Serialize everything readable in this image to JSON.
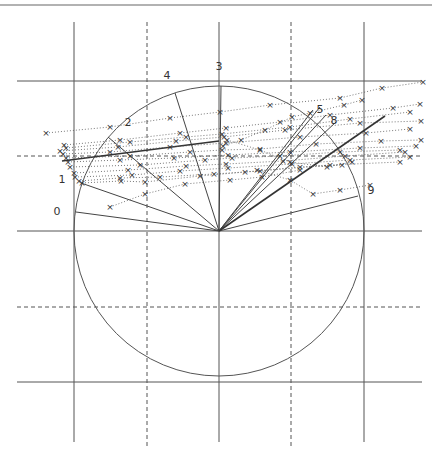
{
  "figure": {
    "top_rule": {
      "x1": 0,
      "x2": 432,
      "y": 5
    },
    "vertical_lines": [
      {
        "x": 74,
        "y1": 22,
        "y2": 442,
        "style": "solid"
      },
      {
        "x": 147,
        "y1": 22,
        "y2": 447,
        "style": "dashed"
      },
      {
        "x": 219,
        "y1": 22,
        "y2": 442,
        "style": "solid"
      },
      {
        "x": 291,
        "y1": 22,
        "y2": 447,
        "style": "dashed"
      },
      {
        "x": 364,
        "y1": 22,
        "y2": 442,
        "style": "solid"
      }
    ],
    "horizontal_lines": [
      {
        "y": 81,
        "x1": 17,
        "x2": 422,
        "style": "solid"
      },
      {
        "y": 156,
        "x1": 17,
        "x2": 422,
        "style": "dashed"
      },
      {
        "y": 231,
        "x1": 17,
        "x2": 422,
        "style": "solid"
      },
      {
        "y": 307,
        "x1": 17,
        "x2": 422,
        "style": "dashed"
      },
      {
        "y": 382,
        "x1": 17,
        "x2": 422,
        "style": "solid"
      }
    ],
    "circle": {
      "cx": 219,
      "cy": 231,
      "r": 145
    },
    "spokes": [
      {
        "label": "0",
        "x": 76,
        "y": 212,
        "lx": 57,
        "ly": 215
      },
      {
        "label": "1",
        "x": 81,
        "y": 183,
        "lx": 62,
        "ly": 183
      },
      {
        "label": "2",
        "x": 108,
        "y": 137,
        "lx": 128,
        "ly": 126
      },
      {
        "label": "4",
        "x": 175,
        "y": 93,
        "lx": 167,
        "ly": 79
      },
      {
        "label": "3",
        "x": 221,
        "y": 86,
        "lx": 219,
        "ly": 70
      },
      {
        "label": "9",
        "x": 358,
        "y": 196,
        "lx": 371,
        "ly": 194
      },
      {
        "label": "8",
        "x": 336,
        "y": 122,
        "lx": 334,
        "ly": 124
      },
      {
        "label": "5",
        "x": 320,
        "y": 107,
        "lx": 320,
        "ly": 113
      }
    ],
    "extra_spokes": [
      {
        "x": 326,
        "y": 115
      },
      {
        "x": 313,
        "y": 110
      }
    ],
    "series_line_color": "#555555",
    "series": [
      {
        "pts": [
          [
            46,
            133
          ],
          [
            110,
            127
          ],
          [
            170,
            118
          ],
          [
            220,
            112
          ],
          [
            270,
            105
          ],
          [
            340,
            98
          ],
          [
            382,
            88
          ],
          [
            423,
            82
          ]
        ]
      },
      {
        "pts": [
          [
            64,
            145
          ],
          [
            120,
            140
          ],
          [
            180,
            133
          ],
          [
            226,
            128
          ],
          [
            280,
            122
          ],
          [
            330,
            115
          ],
          [
            393,
            108
          ],
          [
            420,
            104
          ]
        ]
      },
      {
        "pts": [
          [
            66,
            148
          ],
          [
            130,
            142
          ],
          [
            186,
            137
          ],
          [
            222,
            134
          ],
          [
            290,
            127
          ],
          [
            350,
            119
          ],
          [
            410,
            112
          ]
        ]
      },
      {
        "pts": [
          [
            60,
            151
          ],
          [
            118,
            147
          ],
          [
            176,
            141
          ],
          [
            224,
            137
          ],
          [
            285,
            130
          ],
          [
            360,
            123
          ],
          [
            421,
            121
          ]
        ]
      },
      {
        "pts": [
          [
            63,
            154
          ],
          [
            110,
            152
          ],
          [
            170,
            147
          ],
          [
            226,
            143
          ],
          [
            300,
            137
          ],
          [
            366,
            133
          ],
          [
            410,
            129
          ]
        ]
      },
      {
        "pts": [
          [
            66,
            158
          ],
          [
            130,
            156
          ],
          [
            190,
            152
          ],
          [
            222,
            150
          ],
          [
            260,
            149
          ],
          [
            316,
            144
          ],
          [
            381,
            141
          ],
          [
            421,
            140
          ]
        ]
      },
      {
        "pts": [
          [
            68,
            162
          ],
          [
            120,
            160
          ],
          [
            174,
            158
          ],
          [
            228,
            155
          ],
          [
            290,
            152
          ],
          [
            360,
            148
          ],
          [
            416,
            146
          ]
        ]
      },
      {
        "pts": [
          [
            70,
            167
          ],
          [
            140,
            165
          ],
          [
            205,
            160
          ],
          [
            232,
            158
          ],
          [
            280,
            156
          ],
          [
            340,
            152
          ],
          [
            400,
            150
          ]
        ]
      },
      {
        "pts": [
          [
            74,
            173
          ],
          [
            128,
            170
          ],
          [
            186,
            166
          ],
          [
            226,
            164
          ],
          [
            283,
            161
          ],
          [
            345,
            156
          ],
          [
            405,
            152
          ]
        ]
      },
      {
        "pts": [
          [
            75,
            177
          ],
          [
            132,
            175
          ],
          [
            180,
            171
          ],
          [
            228,
            168
          ],
          [
            292,
            164
          ],
          [
            350,
            160
          ],
          [
            410,
            157
          ]
        ]
      },
      {
        "pts": [
          [
            79,
            181
          ],
          [
            120,
            178
          ],
          [
            160,
            177
          ],
          [
            214,
            174
          ],
          [
            260,
            171
          ],
          [
            330,
            165
          ],
          [
            400,
            162
          ]
        ]
      },
      {
        "pts": [
          [
            82,
            183
          ],
          [
            121,
            181
          ],
          [
            145,
            182
          ],
          [
            200,
            176
          ],
          [
            245,
            172
          ],
          [
            300,
            167
          ],
          [
            342,
            165
          ]
        ]
      },
      {
        "pts": [
          [
            110,
            207
          ],
          [
            145,
            194
          ],
          [
            185,
            184
          ],
          [
            230,
            180
          ],
          [
            262,
            177
          ],
          [
            300,
            170
          ]
        ]
      },
      {
        "pts": [
          [
            257,
            170
          ],
          [
            290,
            180
          ],
          [
            313,
            194
          ],
          [
            340,
            190
          ],
          [
            370,
            185
          ]
        ]
      },
      {
        "pts": [
          [
            223,
            146
          ],
          [
            241,
            140
          ],
          [
            265,
            130
          ],
          [
            292,
            117
          ],
          [
            310,
            113
          ],
          [
            344,
            105
          ],
          [
            362,
            100
          ]
        ]
      },
      {
        "pts": [
          [
            227,
            140
          ],
          [
            260,
            150
          ],
          [
            290,
            162
          ],
          [
            327,
            167
          ],
          [
            352,
            162
          ]
        ]
      }
    ],
    "thick_lines": [
      {
        "x1": 219,
        "y1": 231,
        "x2": 385,
        "y2": 116
      },
      {
        "x1": 62,
        "y1": 161,
        "x2": 219,
        "y2": 141
      }
    ],
    "marker_glyph": "×"
  },
  "caption": "Figure ... : the ... distribution of the ... (text clipped at image bottom)"
}
